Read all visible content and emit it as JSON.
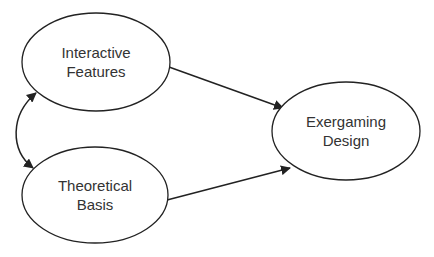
{
  "diagram": {
    "type": "path-diagram",
    "nodes": [
      {
        "id": "interactive",
        "line1": "Interactive",
        "line2": "Features",
        "cx": 96,
        "cy": 62,
        "rx": 74,
        "ry": 49
      },
      {
        "id": "theoretical",
        "line1": "Theoretical",
        "line2": "Basis",
        "cx": 95,
        "cy": 195,
        "rx": 73,
        "ry": 48
      },
      {
        "id": "exergaming",
        "line1": "Exergaming",
        "line2": "Design",
        "cx": 346,
        "cy": 131,
        "rx": 74,
        "ry": 49
      }
    ],
    "edges": [
      {
        "from": "interactive",
        "to": "exergaming",
        "style": "arrow"
      },
      {
        "from": "theoretical",
        "to": "exergaming",
        "style": "arrow"
      },
      {
        "from": "interactive",
        "to": "theoretical",
        "style": "curved-double-arrow"
      }
    ],
    "colors": {
      "stroke": "#222222",
      "text": "#333333",
      "background": "#ffffff"
    }
  }
}
